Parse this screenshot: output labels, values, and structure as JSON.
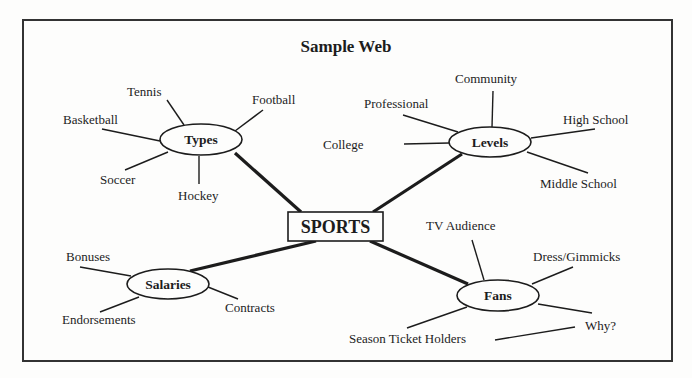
{
  "title": "Sample Web",
  "center": {
    "label": "SPORTS"
  },
  "colors": {
    "ink": "#1c1c1c",
    "background": "#fdfdfc",
    "frame": "#333333"
  },
  "branches": [
    {
      "label": "Types",
      "leaves": [
        "Tennis",
        "Football",
        "Basketball",
        "Soccer",
        "Hockey"
      ]
    },
    {
      "label": "Levels",
      "leaves": [
        "Community",
        "Professional",
        "College",
        "High School",
        "Middle School"
      ]
    },
    {
      "label": "Salaries",
      "leaves": [
        "Bonuses",
        "Endorsements",
        "Contracts"
      ]
    },
    {
      "label": "Fans",
      "leaves": [
        "TV Audience",
        "Dress/Gimmicks",
        "Why?",
        "Season Ticket Holders"
      ]
    }
  ]
}
